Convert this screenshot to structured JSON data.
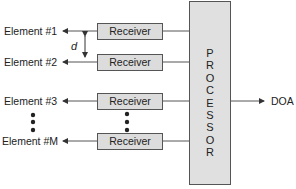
{
  "diagram": {
    "elements": [
      {
        "label": "Element #1"
      },
      {
        "label": "Element #2"
      },
      {
        "label": "Element #3"
      },
      {
        "label": "Element #M"
      }
    ],
    "receivers": [
      {
        "label": "Receiver"
      },
      {
        "label": "Receiver"
      },
      {
        "label": "Receiver"
      },
      {
        "label": "Receiver"
      }
    ],
    "spacing_label": "d",
    "processor_label": "PROCESSOR",
    "processor_letters": [
      "P",
      "R",
      "O",
      "C",
      "E",
      "S",
      "S",
      "O",
      "R"
    ],
    "output_label": "DOA",
    "ellipsis": "vertical dots"
  }
}
